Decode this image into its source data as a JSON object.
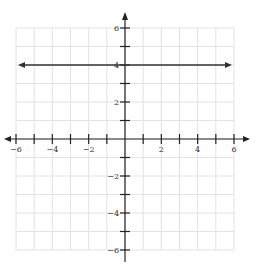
{
  "chart_data": {
    "type": "line",
    "title": "",
    "xlabel": "",
    "ylabel": "",
    "xlim": [
      -6,
      6
    ],
    "ylim": [
      -6,
      6
    ],
    "grid": true,
    "x_tick_labels": [
      "-6",
      "-4",
      "-2",
      "2",
      "4",
      "6"
    ],
    "y_tick_labels": [
      "6",
      "4",
      "2",
      "-2",
      "-4",
      "-6"
    ],
    "series": [
      {
        "name": "y = 4",
        "equation": "y = 4",
        "x": [
          -6,
          6
        ],
        "y": [
          4,
          4
        ],
        "arrows": "both"
      }
    ]
  },
  "colors": {
    "grid": "#e2e2e2",
    "axis": "#222222",
    "line": "#333333"
  }
}
